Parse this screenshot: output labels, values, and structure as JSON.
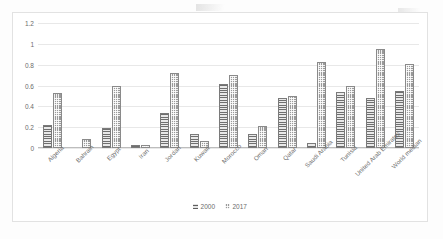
{
  "chart_data": {
    "type": "bar",
    "title": "",
    "subtitle": "",
    "xlabel": "",
    "ylabel": "",
    "ylim": [
      0,
      1.2
    ],
    "yticks": [
      "0",
      "0.2",
      "0.4",
      "0.6",
      "0.8",
      "1",
      "1.2"
    ],
    "ytick_values": [
      0,
      0.2,
      0.4,
      0.6,
      0.8,
      1,
      1.2
    ],
    "grid": true,
    "legend_position": "bottom",
    "categories": [
      "Algeria",
      "Bahrain",
      "Egypt",
      "Iran",
      "Jordan",
      "Kuwait",
      "Morocco",
      "Oman",
      "Qatar",
      "Saudi Arabia",
      "Tunisia",
      "United Arab Emirates",
      "World median"
    ],
    "series": [
      {
        "name": "2000",
        "color": "#8c8c8c",
        "pattern": "horizontal-lines",
        "values": [
          0.22,
          0.0,
          0.19,
          0.03,
          0.34,
          0.13,
          0.61,
          0.13,
          0.48,
          0.05,
          0.54,
          0.48,
          0.55
        ]
      },
      {
        "name": "2017",
        "color": "#9a9a9a",
        "pattern": "dotted-grid",
        "values": [
          0.53,
          0.09,
          0.6,
          0.03,
          0.72,
          0.07,
          0.7,
          0.21,
          0.5,
          0.83,
          0.6,
          0.95,
          0.81
        ]
      }
    ]
  },
  "legend": {
    "items": [
      {
        "label": "2000"
      },
      {
        "label": "2017"
      }
    ]
  },
  "colors": {
    "series_2000": "#8c8c8c",
    "series_2017": "#9a9a9a",
    "gridline": "#e8e8e8",
    "axis": "#bdbdbd",
    "text": "#6b6b6b",
    "frame": "#e2e2e2",
    "background": "#ffffff"
  }
}
